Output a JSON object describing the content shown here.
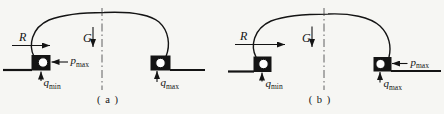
{
  "theme": {
    "background": "#f6f6f3",
    "ink": "#141414",
    "centerline": "#3a3a3a",
    "wheel-bore": "#ffffff"
  },
  "panels": [
    {
      "caption": "( a )",
      "labels": {
        "lateral": "R",
        "gravity": "G",
        "p": "p",
        "p_sub": "max",
        "q_left": "q",
        "q_left_sub": "min",
        "q_right": "q",
        "q_right_sub": "max"
      }
    },
    {
      "caption": "( b )",
      "labels": {
        "lateral": "R",
        "gravity": "G",
        "p": "p",
        "p_sub": "max",
        "q_left": "q",
        "q_left_sub": "min",
        "q_right": "q",
        "q_right_sub": "max"
      }
    }
  ]
}
